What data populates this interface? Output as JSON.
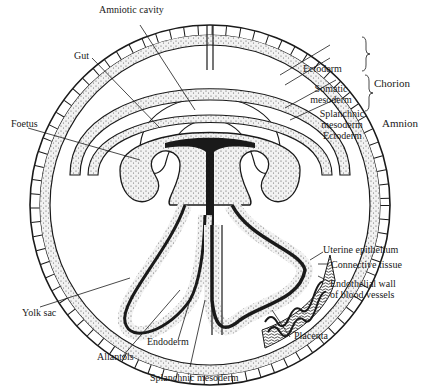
{
  "diagram": {
    "labels": {
      "amniotic_cavity": "Amniotic cavity",
      "gut": "Gut",
      "foetus": "Foetus",
      "yolk_sac": "Yolk sac",
      "allantois": "Allantois",
      "endoderm": "Endoderm",
      "splanchnic_mesoderm_bottom": "Splanchnic mesoderm",
      "chorion_ectoderm": "Ectoderm",
      "somatic_mesoderm_1": "Somatic",
      "somatic_mesoderm_2": "mesoderm",
      "amnion_splanchnic_1": "Splanchnic",
      "amnion_splanchnic_2": "mesoderm",
      "amnion_ectoderm": "Ectoderm",
      "uterine_epithelium": "Uterine epithelium",
      "connective_tissue": "Connective tissue",
      "endothelial_1": "Endothelial wall",
      "endothelial_2": "of blood vessels",
      "placenta": "Placenta"
    },
    "groups": {
      "chorion": "Chorion",
      "amnion": "Amnion"
    },
    "colors": {
      "ink": "#1a1a1a",
      "stipple": "#9a9a9a",
      "background": "#ffffff"
    }
  }
}
